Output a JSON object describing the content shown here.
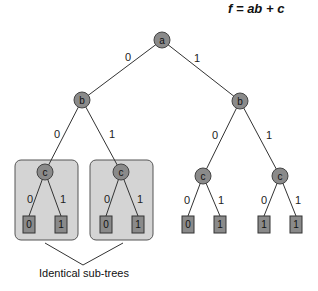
{
  "title": "f = ab + c",
  "caption": "Identical sub-trees",
  "nodes": {
    "a": {
      "label": "a"
    },
    "b_left": {
      "label": "b"
    },
    "b_right": {
      "label": "b"
    },
    "c1": {
      "label": "c"
    },
    "c2": {
      "label": "c"
    },
    "c3": {
      "label": "c"
    },
    "c4": {
      "label": "c"
    }
  },
  "edges": {
    "a_b_left": "0",
    "a_b_right": "1",
    "bl_c1": "0",
    "bl_c2": "1",
    "br_c3": "0",
    "br_c4": "1",
    "c1_l0": "0",
    "c1_l1": "1",
    "c2_l0": "0",
    "c2_l1": "1",
    "c3_l0": "0",
    "c3_l1": "1",
    "c4_l0": "0",
    "c4_l1": "1"
  },
  "leaves": {
    "c1_low": "0",
    "c1_high": "1",
    "c2_low": "0",
    "c2_high": "1",
    "c3_low": "0",
    "c3_high": "1",
    "c4_low": "1",
    "c4_high": "1"
  },
  "colors": {
    "node_fill": "#8a8a8a",
    "group_fill": "#d4d4d4"
  }
}
